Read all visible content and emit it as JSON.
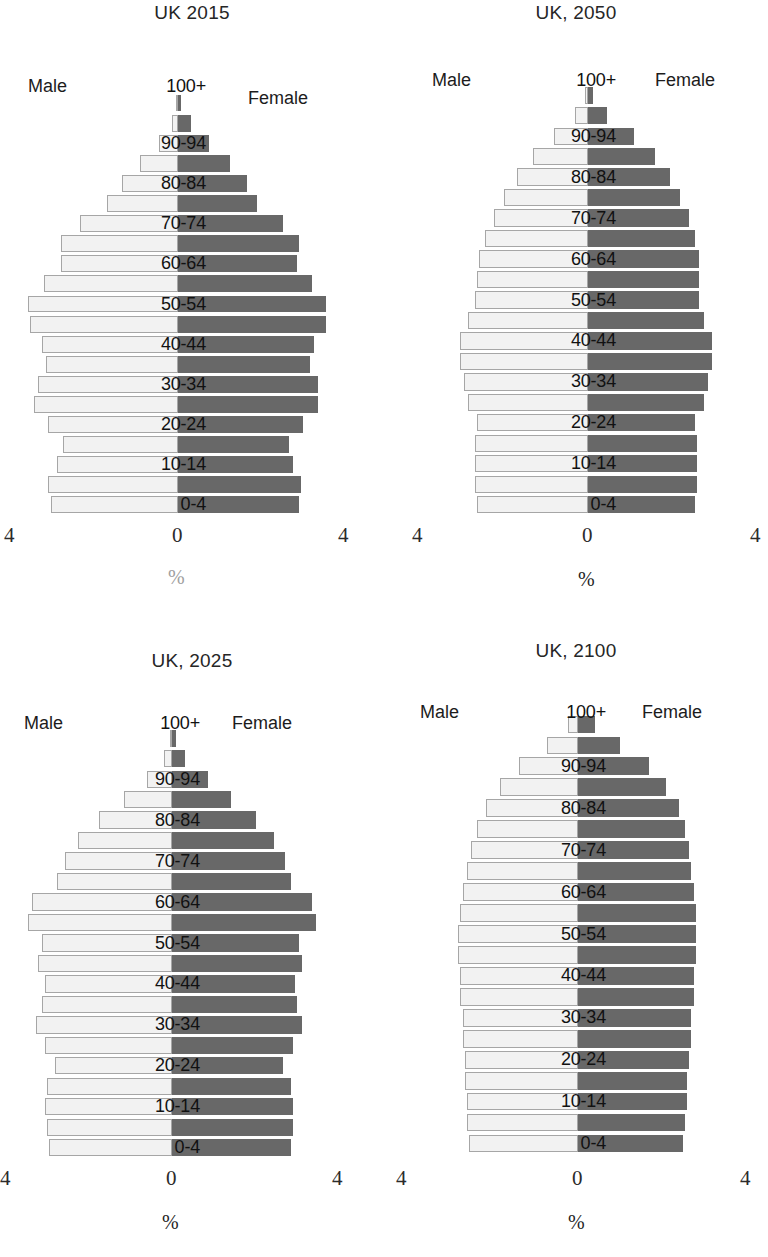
{
  "figure": {
    "kind": "population-pyramid-grid",
    "panel_count": 4,
    "age_groups": [
      "0-4",
      "5-9",
      "10-14",
      "15-19",
      "20-24",
      "25-29",
      "30-34",
      "35-39",
      "40-44",
      "45-49",
      "50-54",
      "55-59",
      "60-64",
      "65-69",
      "70-74",
      "75-79",
      "80-84",
      "85-89",
      "90-94",
      "95-99",
      "100+"
    ],
    "labelled_age_groups": [
      "0-4",
      "10-14",
      "20-24",
      "30-34",
      "40-44",
      "50-54",
      "60-64",
      "70-74",
      "80-84",
      "90-94",
      "100+"
    ],
    "male_legend": "Male",
    "female_legend": "Female",
    "axis_ticks": [
      "4",
      "0",
      "4"
    ],
    "axis_unit": "%",
    "colors": {
      "male_fill": "#f2f2f2",
      "male_border": "#a6a6a6",
      "female_fill": "#686868",
      "title": "#262626",
      "text": "#111111",
      "axis_unit_muted": "#a0a0a0"
    }
  },
  "chart_data": [
    {
      "type": "bar",
      "title": "UK 2015",
      "xlabel": "%",
      "ylabel": "",
      "xlim": [
        -4,
        4
      ],
      "xticks": [
        4,
        0,
        4
      ],
      "grid": false,
      "legend_position": "top-left-and-top-right",
      "categories": [
        "0-4",
        "5-9",
        "10-14",
        "15-19",
        "20-24",
        "25-29",
        "30-34",
        "35-39",
        "40-44",
        "45-49",
        "50-54",
        "55-59",
        "60-64",
        "65-69",
        "70-74",
        "75-79",
        "80-84",
        "85-89",
        "90-94",
        "95-99",
        "100+"
      ],
      "series": [
        {
          "name": "Male",
          "values": [
            3.05,
            3.1,
            2.9,
            2.75,
            3.1,
            3.45,
            3.35,
            3.15,
            3.25,
            3.55,
            3.6,
            3.2,
            2.8,
            2.8,
            2.35,
            1.7,
            1.35,
            0.9,
            0.45,
            0.15,
            0.04
          ]
        },
        {
          "name": "Female",
          "values": [
            2.9,
            2.95,
            2.75,
            2.65,
            3.0,
            3.35,
            3.35,
            3.15,
            3.25,
            3.55,
            3.55,
            3.2,
            2.85,
            2.9,
            2.5,
            1.9,
            1.65,
            1.25,
            0.75,
            0.3,
            0.08
          ]
        }
      ]
    },
    {
      "type": "bar",
      "title": "UK, 2050",
      "xlabel": "%",
      "ylabel": "",
      "xlim": [
        -4,
        4
      ],
      "xticks": [
        4,
        0,
        4
      ],
      "grid": false,
      "legend_position": "top-left-and-top-right",
      "categories": [
        "0-4",
        "5-9",
        "10-14",
        "15-19",
        "20-24",
        "25-29",
        "30-34",
        "35-39",
        "40-44",
        "45-49",
        "50-54",
        "55-59",
        "60-64",
        "65-69",
        "70-74",
        "75-79",
        "80-84",
        "85-89",
        "90-94",
        "95-99",
        "100+"
      ],
      "series": [
        {
          "name": "Male",
          "values": [
            2.65,
            2.7,
            2.7,
            2.7,
            2.65,
            2.85,
            2.95,
            3.05,
            3.05,
            2.85,
            2.7,
            2.65,
            2.6,
            2.45,
            2.25,
            2.0,
            1.7,
            1.3,
            0.8,
            0.3,
            0.07
          ]
        },
        {
          "name": "Female",
          "values": [
            2.55,
            2.6,
            2.6,
            2.6,
            2.55,
            2.75,
            2.85,
            2.95,
            2.95,
            2.75,
            2.65,
            2.65,
            2.65,
            2.55,
            2.4,
            2.2,
            1.95,
            1.6,
            1.1,
            0.45,
            0.12
          ]
        }
      ]
    },
    {
      "type": "bar",
      "title": "UK, 2025",
      "xlabel": "%",
      "ylabel": "",
      "xlim": [
        -4,
        4
      ],
      "xticks": [
        4,
        0,
        4
      ],
      "grid": false,
      "legend_position": "top-left-and-top-right",
      "categories": [
        "0-4",
        "5-9",
        "10-14",
        "15-19",
        "20-24",
        "25-29",
        "30-34",
        "35-39",
        "40-44",
        "45-49",
        "50-54",
        "55-59",
        "60-64",
        "65-69",
        "70-74",
        "75-79",
        "80-84",
        "85-89",
        "90-94",
        "95-99",
        "100+"
      ],
      "series": [
        {
          "name": "Male",
          "values": [
            2.95,
            3.0,
            3.05,
            3.0,
            2.8,
            3.05,
            3.25,
            3.1,
            3.05,
            3.2,
            3.1,
            3.45,
            3.35,
            2.75,
            2.55,
            2.25,
            1.75,
            1.15,
            0.6,
            0.2,
            0.05
          ]
        },
        {
          "name": "Female",
          "values": [
            2.85,
            2.9,
            2.9,
            2.85,
            2.65,
            2.9,
            3.1,
            3.0,
            2.95,
            3.1,
            3.05,
            3.45,
            3.35,
            2.85,
            2.7,
            2.45,
            2.0,
            1.4,
            0.85,
            0.3,
            0.09
          ]
        }
      ]
    },
    {
      "type": "bar",
      "title": "UK, 2100",
      "xlabel": "%",
      "ylabel": "",
      "xlim": [
        -4,
        4
      ],
      "xticks": [
        4,
        0,
        4
      ],
      "grid": false,
      "legend_position": "top-left-and-top-right",
      "categories": [
        "0-4",
        "5-9",
        "10-14",
        "15-19",
        "20-24",
        "25-29",
        "30-34",
        "35-39",
        "40-44",
        "45-49",
        "50-54",
        "55-59",
        "60-64",
        "65-69",
        "70-74",
        "75-79",
        "80-84",
        "85-89",
        "90-94",
        "95-99",
        "100+"
      ],
      "series": [
        {
          "name": "Male",
          "values": [
            2.6,
            2.65,
            2.65,
            2.7,
            2.7,
            2.75,
            2.75,
            2.8,
            2.8,
            2.85,
            2.85,
            2.8,
            2.75,
            2.65,
            2.55,
            2.4,
            2.2,
            1.85,
            1.4,
            0.75,
            0.25
          ]
        },
        {
          "name": "Female",
          "values": [
            2.5,
            2.55,
            2.6,
            2.6,
            2.65,
            2.7,
            2.7,
            2.75,
            2.75,
            2.8,
            2.8,
            2.8,
            2.75,
            2.7,
            2.65,
            2.55,
            2.4,
            2.1,
            1.7,
            1.0,
            0.4
          ]
        }
      ]
    }
  ],
  "panels": [
    {
      "id": "uk-2015",
      "title": "UK 2015",
      "male_label": "Male",
      "female_label": "Female",
      "tick_left": "4",
      "tick_center": "0",
      "tick_right": "4",
      "unit": "%",
      "unit_muted": true
    },
    {
      "id": "uk-2050",
      "title": "UK, 2050",
      "male_label": "Male",
      "female_label": "Female",
      "tick_left": "4",
      "tick_center": "0",
      "tick_right": "4",
      "unit": "%",
      "unit_muted": false
    },
    {
      "id": "uk-2025",
      "title": "UK, 2025",
      "male_label": "Male",
      "female_label": "Female",
      "tick_left": "4",
      "tick_center": "0",
      "tick_right": "4",
      "unit": "%",
      "unit_muted": false
    },
    {
      "id": "uk-2100",
      "title": "UK, 2100",
      "male_label": "Male",
      "female_label": "Female",
      "tick_left": "4",
      "tick_center": "0",
      "tick_right": "4",
      "unit": "%",
      "unit_muted": false
    }
  ]
}
